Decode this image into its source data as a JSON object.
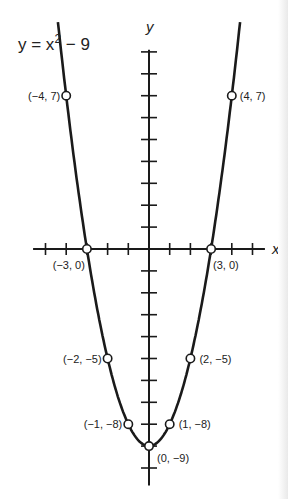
{
  "chart_data": {
    "type": "line",
    "equation": {
      "prefix": "y = x",
      "exp": "2",
      "suffix": " − 9"
    },
    "xlabel": "x",
    "ylabel": "y",
    "xlim": [
      -5,
      5
    ],
    "ylim": [
      -10,
      9
    ],
    "grid": false,
    "points": [
      {
        "x": -4,
        "y": 7,
        "label": "(−4, 7)"
      },
      {
        "x": -3,
        "y": 0,
        "label": "(−3, 0)"
      },
      {
        "x": -2,
        "y": -5,
        "label": "(−2, −5)"
      },
      {
        "x": -1,
        "y": -8,
        "label": "(−1, −8)"
      },
      {
        "x": 0,
        "y": -9,
        "label": "(0, −9)"
      },
      {
        "x": 1,
        "y": -8,
        "label": "(1, −8)"
      },
      {
        "x": 2,
        "y": -5,
        "label": "(2, −5)"
      },
      {
        "x": 3,
        "y": 0,
        "label": "(3, 0)"
      },
      {
        "x": 4,
        "y": 7,
        "label": "(4, 7)"
      }
    ]
  }
}
